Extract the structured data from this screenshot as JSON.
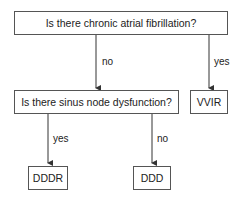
{
  "diagram": {
    "type": "decision-flowchart",
    "nodes": {
      "q1": "Is there chronic atrial fibrillation?",
      "q2": "Is there sinus node dysfunction?",
      "vvir": "VVIR",
      "dddr": "DDDR",
      "ddd": "DDD"
    },
    "edges": {
      "q1_no": "no",
      "q1_yes": "yes",
      "q2_yes": "yes",
      "q2_no": "no"
    },
    "colors": {
      "line": "#333333",
      "border": "#555555",
      "text": "#222222"
    }
  }
}
